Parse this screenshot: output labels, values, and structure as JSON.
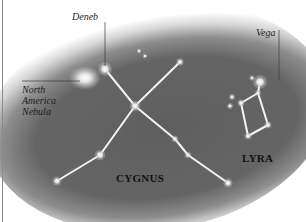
{
  "chart_data": {
    "type": "diagram",
    "title": "",
    "labels": {
      "deneb": "Deneb",
      "vega": "Vega",
      "nebula": [
        "North",
        "America",
        "Nebula"
      ],
      "cygnus": "CYGNUS",
      "lyra": "LYRA"
    },
    "colors": {
      "sky_dark": "#5e5e5e",
      "sky_mid": "#8c8c8c",
      "background": "#ffffff",
      "star": "#e8e8e8",
      "line": "#f4f4f4",
      "label_text": "#1e1e1e",
      "leader_line": "#3a3a3a"
    },
    "stars": [
      {
        "name": "Deneb",
        "x": 105,
        "y": 69,
        "r": 4.5
      },
      {
        "name": "Sadr",
        "x": 135,
        "y": 106,
        "r": 3.5
      },
      {
        "name": "cyg-ne",
        "x": 180,
        "y": 62,
        "r": 2.5
      },
      {
        "name": "cyg-se1",
        "x": 175,
        "y": 139,
        "r": 2.2
      },
      {
        "name": "cyg-se2",
        "x": 188,
        "y": 155,
        "r": 2.2
      },
      {
        "name": "Albireo",
        "x": 228,
        "y": 183,
        "r": 3
      },
      {
        "name": "cyg-sw1",
        "x": 100,
        "y": 155,
        "r": 3.5
      },
      {
        "name": "cyg-sw2",
        "x": 57,
        "y": 181,
        "r": 3
      },
      {
        "name": "small-a",
        "x": 139,
        "y": 51,
        "r": 1.6
      },
      {
        "name": "small-b",
        "x": 145,
        "y": 56,
        "r": 1.6
      },
      {
        "name": "Vega",
        "x": 260,
        "y": 82,
        "r": 4.5
      },
      {
        "name": "lyr-near",
        "x": 252,
        "y": 78,
        "r": 1.8
      },
      {
        "name": "lyr-1",
        "x": 258,
        "y": 93,
        "r": 2
      },
      {
        "name": "lyr-2",
        "x": 241,
        "y": 103,
        "r": 2.4
      },
      {
        "name": "lyr-3",
        "x": 268,
        "y": 125,
        "r": 2.4
      },
      {
        "name": "lyr-4",
        "x": 248,
        "y": 136,
        "r": 2.4
      },
      {
        "name": "small-c",
        "x": 232,
        "y": 97,
        "r": 2
      },
      {
        "name": "small-d",
        "x": 230,
        "y": 106,
        "r": 2
      }
    ],
    "lines": [
      [
        "Deneb",
        "Sadr"
      ],
      [
        "Sadr",
        "cyg-ne"
      ],
      [
        "Sadr",
        "cyg-se1"
      ],
      [
        "cyg-se1",
        "cyg-se2"
      ],
      [
        "cyg-se2",
        "Albireo"
      ],
      [
        "Sadr",
        "cyg-sw1"
      ],
      [
        "cyg-sw1",
        "cyg-sw2"
      ],
      [
        "Vega",
        "lyr-1"
      ],
      [
        "lyr-1",
        "lyr-2"
      ],
      [
        "lyr-1",
        "lyr-3"
      ],
      [
        "lyr-2",
        "lyr-4"
      ],
      [
        "lyr-3",
        "lyr-4"
      ]
    ],
    "nebula_glow": {
      "x": 85,
      "y": 78,
      "r": 14
    }
  }
}
